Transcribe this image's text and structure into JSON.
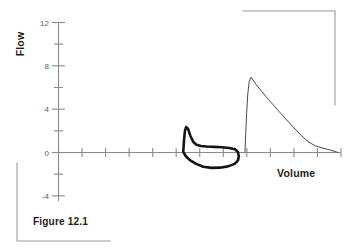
{
  "figure": {
    "caption": "Figure 12.1"
  },
  "chart_data": {
    "type": "line",
    "title": "",
    "xlabel": "Volume",
    "ylabel": "Flow",
    "grid": false,
    "legend": "none",
    "xlim": [
      0,
      12
    ],
    "ylim": [
      -4,
      12
    ],
    "ytick_labels": [
      "12",
      "8",
      "4",
      "0",
      "-4"
    ],
    "ytick_values": [
      12,
      8,
      4,
      0,
      -4
    ],
    "yminor_values": [
      10,
      6,
      2,
      -2
    ],
    "xtick_values": [
      0,
      1,
      2,
      3,
      4,
      5,
      6,
      7,
      8,
      9,
      10,
      11,
      12
    ],
    "xtick_labels": [],
    "series": [
      {
        "name": "tidal-breathing-loop",
        "style": "thick",
        "closed": true,
        "points": [
          [
            5.3,
            0.05
          ],
          [
            5.33,
            1.1
          ],
          [
            5.37,
            2.0
          ],
          [
            5.42,
            2.35
          ],
          [
            5.5,
            2.2
          ],
          [
            5.6,
            1.55
          ],
          [
            5.72,
            1.0
          ],
          [
            5.86,
            0.72
          ],
          [
            6.05,
            0.6
          ],
          [
            6.3,
            0.55
          ],
          [
            6.6,
            0.52
          ],
          [
            6.95,
            0.48
          ],
          [
            7.25,
            0.42
          ],
          [
            7.5,
            0.3
          ],
          [
            7.62,
            0.05
          ],
          [
            7.66,
            -0.35
          ],
          [
            7.62,
            -0.75
          ],
          [
            7.48,
            -1.05
          ],
          [
            7.2,
            -1.28
          ],
          [
            6.85,
            -1.4
          ],
          [
            6.5,
            -1.42
          ],
          [
            6.15,
            -1.32
          ],
          [
            5.85,
            -1.05
          ],
          [
            5.58,
            -0.7
          ],
          [
            5.4,
            -0.32
          ],
          [
            5.3,
            0.05
          ]
        ]
      },
      {
        "name": "forced-expiratory-curve",
        "style": "thin",
        "closed": false,
        "points": [
          [
            7.92,
            0.0
          ],
          [
            7.95,
            1.6
          ],
          [
            7.99,
            3.6
          ],
          [
            8.04,
            5.4
          ],
          [
            8.1,
            6.55
          ],
          [
            8.18,
            6.95
          ],
          [
            8.4,
            6.25
          ],
          [
            8.8,
            5.2
          ],
          [
            9.3,
            3.95
          ],
          [
            9.8,
            2.75
          ],
          [
            10.25,
            1.7
          ],
          [
            10.6,
            1.0
          ],
          [
            10.9,
            0.62
          ],
          [
            11.2,
            0.42
          ],
          [
            11.55,
            0.22
          ],
          [
            11.85,
            0.02
          ]
        ]
      }
    ]
  },
  "brackets": {
    "top_right": "corner-bracket-top-right",
    "bottom_left": "corner-bracket-bottom-left"
  }
}
